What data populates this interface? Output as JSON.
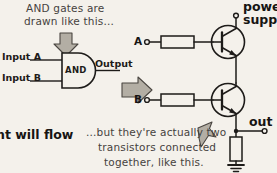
{
  "figure": {
    "background_color": "#f4f1eb",
    "ink_color": "#1d1b19",
    "arrow_fill": "#b9b4aa"
  },
  "annotations": {
    "caption_top_line1": "AND gates are",
    "caption_top_line2": "drawn like this...",
    "caption_bottom_line1": "...but they're actually two",
    "caption_bottom_line2": "transistors connected",
    "caption_bottom_line3": "together, like this.",
    "caption_left_clipped": "nt will flow"
  },
  "logic_gate": {
    "body_label": "AND",
    "input_a_label": "Input A",
    "input_b_label": "Input B",
    "output_label": "Output"
  },
  "circuit": {
    "terminal_a_label": "A",
    "terminal_b_label": "B",
    "power_label_line1": "power",
    "power_label_line2": "supply",
    "output_label": "out",
    "components": [
      {
        "name": "base-resistor-a",
        "type": "resistor"
      },
      {
        "name": "base-resistor-b",
        "type": "resistor"
      },
      {
        "name": "transistor-upper",
        "type": "npn-transistor"
      },
      {
        "name": "transistor-lower",
        "type": "npn-transistor"
      },
      {
        "name": "pulldown-resistor",
        "type": "resistor"
      },
      {
        "name": "ground-symbol",
        "type": "ground"
      }
    ]
  },
  "icons": {
    "down_arrow": "down-arrow-icon",
    "right_arrow": "right-arrow-icon",
    "up_right_arrow": "up-right-arrow-icon"
  }
}
